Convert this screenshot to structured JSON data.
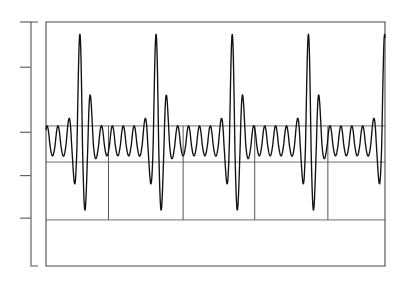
{
  "figure": {
    "width": 406,
    "height": 288,
    "background": "#ffffff",
    "title": "",
    "caption": ""
  },
  "chart_data": {
    "type": "line",
    "title": "",
    "subtitle": "",
    "xlabel": "",
    "ylabel": "",
    "xlim": [
      0,
      4.45
    ],
    "ylim": [
      -1.35,
      1.35
    ],
    "grid": true,
    "legend": null,
    "legend_position": "none",
    "annotations": [],
    "xticklabels": [],
    "yticklabels": [],
    "series": [
      {
        "name": "waveform",
        "color": "#111111",
        "linewidth": 1.35,
        "n_points": 1400,
        "x_range": [
          0,
          4.45
        ],
        "period": 1.0,
        "carrier_cycles_per_period": 7,
        "baseline": 0.0,
        "ripple_amplitude": 0.2,
        "peak_value": 1.28,
        "trough_value": -0.84,
        "peak_x_positions": [
          0.46,
          1.46,
          2.41,
          3.44
        ],
        "trough_x_positions": [
          0.64,
          1.66,
          2.6,
          3.61
        ],
        "formula": "y(t) = A(t) * sin(2*pi*7*t + phi), A(t) = 0.2 + 1.1*exp(-((t mod 1 - 0.47)/0.105)^2)"
      }
    ],
    "y_gridlines": [
      0.2,
      -0.2,
      -0.84
    ],
    "x_gridlines": [
      0.82,
      1.8,
      2.74,
      3.7
    ],
    "y_axis_ticks": [
      1.35,
      0.85,
      0.13,
      -0.35,
      -0.82
    ],
    "axis_spine": {
      "x": 31,
      "y_top": 22,
      "y_bottom": 266,
      "tick_length": 11,
      "color": "#555555"
    },
    "plot_frame": {
      "left": 46,
      "right": 385,
      "top": 22,
      "bottom": 266,
      "color": "#4a4a4a"
    }
  }
}
